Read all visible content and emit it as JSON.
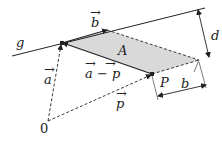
{
  "diagram": {
    "colors": {
      "stroke": "#222222",
      "fill_parallelogram": "#d9d9d9",
      "background": "#ffffff"
    },
    "points": {
      "origin": {
        "label": "0",
        "x": 48,
        "y": 121
      },
      "A": {
        "x": 62,
        "y": 43
      },
      "B": {
        "x": 107,
        "y": 30
      },
      "R": {
        "x": 199,
        "y": 60
      },
      "P": {
        "label": "P",
        "x": 152,
        "y": 74
      }
    },
    "labels": {
      "line": "g",
      "vector_b": "b",
      "vector_a": "a",
      "vector_a_minus_p": "a − p",
      "vector_p": "p",
      "area": "A",
      "point_p": "P",
      "distance": "d",
      "base_length": "b",
      "origin": "0"
    },
    "vector_arrow_glyph": "→"
  }
}
